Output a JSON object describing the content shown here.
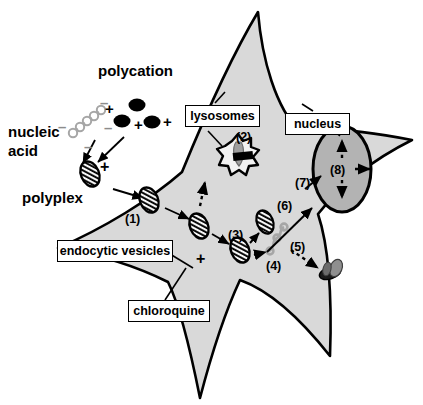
{
  "figure": {
    "type": "cell-transfection-pathway-diagram",
    "background": "#ffffff"
  },
  "colors": {
    "cytoplasm_fill": "#d9d9d9",
    "nucleus_fill": "#b3b3b3",
    "outline": "#000000",
    "nucleic_acid_gray": "#a6a6a6",
    "polycation_black": "#000000",
    "vesicle_fill": "#f2f2f2",
    "box_border": "#000000",
    "box_fill": "#ffffff"
  },
  "free_labels": {
    "polycation": "polycation",
    "nucleic_acid_line1": "nucleic",
    "nucleic_acid_line2": "acid",
    "polyplex": "polyplex"
  },
  "boxed_labels": {
    "lysosomes": "lysosomes",
    "nucleus": "nucleus",
    "endocytic_vesicles": "endocytic vesicles",
    "chloroquine": "chloroquine"
  },
  "steps": [
    {
      "id": "1",
      "label": "(1)",
      "meaning": "endocytosis of polyplex at plasma membrane"
    },
    {
      "id": "2",
      "label": "(2)",
      "meaning": "lysosomal degradation"
    },
    {
      "id": "3",
      "label": "(3)",
      "meaning": "endosomal escape"
    },
    {
      "id": "4",
      "label": "(4)",
      "meaning": "release of free nucleic acid in cytoplasm"
    },
    {
      "id": "5",
      "label": "(5)",
      "meaning": "cytoplasmic degradation"
    },
    {
      "id": "6",
      "label": "(6)",
      "meaning": "trafficking toward nucleus"
    },
    {
      "id": "7",
      "label": "(7)",
      "meaning": "nuclear entry"
    },
    {
      "id": "8",
      "label": "(8)",
      "meaning": "intranuclear distribution"
    }
  ],
  "charges": {
    "polycation_plus": [
      "+",
      "+",
      "+"
    ],
    "nucleic_acid_minus": [
      "–",
      "–",
      "–",
      "–"
    ],
    "polyplex_plus": "+",
    "chloroquine_plus": "+"
  }
}
